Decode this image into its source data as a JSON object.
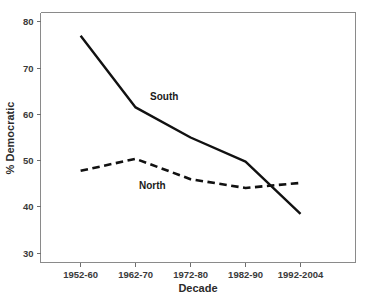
{
  "chart_data": {
    "type": "line",
    "title": "",
    "xlabel": "Decade",
    "ylabel": "% Democratic",
    "categories": [
      "1952-60",
      "1962-70",
      "1972-80",
      "1982-90",
      "1992-2004"
    ],
    "ylim": [
      28,
      82
    ],
    "yticks": [
      30,
      40,
      50,
      60,
      70,
      80
    ],
    "ytick_labels": [
      "30",
      "40",
      "50",
      "60",
      "70",
      "80"
    ],
    "grid": false,
    "legend_position": "inline-annotations",
    "series": [
      {
        "name": "South",
        "style": "solid",
        "color": "#111111",
        "values": [
          77.0,
          61.5,
          55.0,
          49.8,
          38.5
        ],
        "label_text": "South"
      },
      {
        "name": "North",
        "style": "dashed",
        "color": "#111111",
        "values": [
          47.8,
          50.4,
          46.0,
          44.1,
          45.2
        ],
        "label_text": "North"
      }
    ],
    "annotations": [
      {
        "text": "South",
        "series": "South"
      },
      {
        "text": "North",
        "series": "North"
      }
    ]
  },
  "axis": {
    "y_title": "% Democratic",
    "x_title": "Decade",
    "y_tick_0": "30",
    "y_tick_1": "40",
    "y_tick_2": "50",
    "y_tick_3": "60",
    "y_tick_4": "70",
    "y_tick_5": "80",
    "x_tick_0": "1952-60",
    "x_tick_1": "1962-70",
    "x_tick_2": "1972-80",
    "x_tick_3": "1982-90",
    "x_tick_4": "1992-2004"
  },
  "labels": {
    "south": "South",
    "north": "North"
  },
  "colors": {
    "line": "#111111",
    "frame": "#8a8a8a",
    "text": "#1a1a1a",
    "background": "#ffffff"
  }
}
